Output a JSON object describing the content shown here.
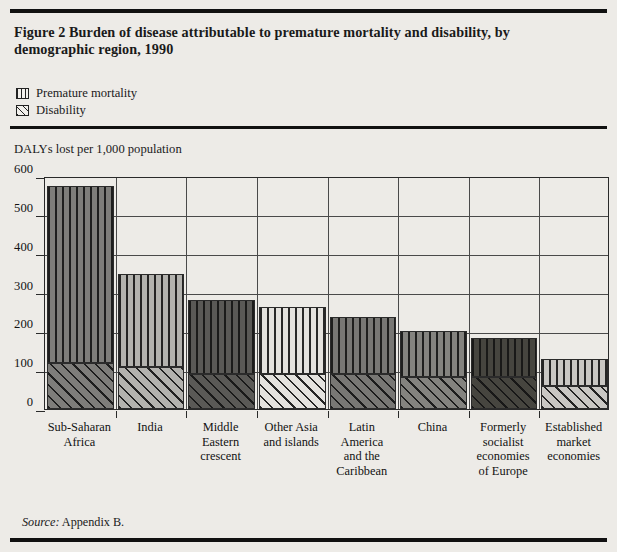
{
  "figure": {
    "title": "Figure 2  Burden of disease attributable to premature mortality and disability,\nby demographic region, 1990",
    "source_label": "Source:",
    "source_text": "Appendix B."
  },
  "legend": {
    "items": [
      {
        "label": "Premature mortality",
        "icon": "vertical-hatch-swatch"
      },
      {
        "label": "Disability",
        "icon": "diagonal-hatch-swatch"
      }
    ]
  },
  "chart_data": {
    "type": "bar",
    "subtype": "stacked",
    "title": "Burden of disease attributable to premature mortality and disability, by demographic region, 1990",
    "xlabel": "",
    "ylabel": "DALYs lost per 1,000 population",
    "ylim": [
      0,
      600
    ],
    "yticks": [
      0,
      100,
      200,
      300,
      400,
      500,
      600
    ],
    "ytick_labels": [
      "0",
      "100",
      "200",
      "300",
      "400",
      "500",
      "600"
    ],
    "grid": true,
    "legend_position": "above-plot",
    "categories": [
      "Sub-Saharan\nAfrica",
      "India",
      "Middle\nEastern\ncrescent",
      "Other Asia\nand islands",
      "Latin\nAmerica\nand the\nCaribbean",
      "China",
      "Formerly\nsocialist\neconomies\nof Europe",
      "Established\nmarket\neconomies"
    ],
    "series": [
      {
        "name": "Premature mortality",
        "values": [
          456,
          240,
          192,
          172,
          145,
          118,
          100,
          69
        ]
      },
      {
        "name": "Disability",
        "values": [
          119,
          108,
          90,
          90,
          91,
          83,
          83,
          59
        ]
      }
    ],
    "totals": [
      575,
      348,
      282,
      262,
      236,
      201,
      183,
      128
    ],
    "bar_fills": [
      "#7e7d7a",
      "#b3b2ae",
      "#5a5956",
      "#e4e2de",
      "#787774",
      "#84837f",
      "#46453f",
      "#c9c7c3"
    ]
  }
}
